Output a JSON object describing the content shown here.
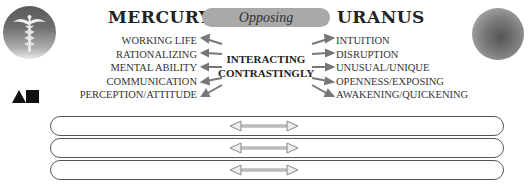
{
  "diagram": {
    "left_planet": {
      "name": "MERCURY",
      "icon": "caduceus-icon",
      "traits": [
        "WORKING LIFE",
        "RATIONALIZING",
        "MENTAL ABILITY",
        "COMMUNICATION",
        "PERCEPTION/ATTITUDE"
      ]
    },
    "right_planet": {
      "name": "URANUS",
      "icon": "shaded-sphere-icon",
      "traits": [
        "INTUITION",
        "DISRUPTION",
        "UNUSUAL/UNIQUE",
        "OPENNESS/EXPOSING",
        "AWAKENING/QUICKENING"
      ]
    },
    "aspect_label": "Opposing",
    "center_label": [
      "INTERACTING",
      "CONTRASTINGLY"
    ],
    "symbol": "triangle-square-icon",
    "bars": [
      {
        "arrow": "double-arrow-icon"
      },
      {
        "arrow": "double-arrow-icon"
      },
      {
        "arrow": "double-arrow-icon"
      }
    ],
    "colors": {
      "pill": "#a9a9a9",
      "arrow": "#888888",
      "text": "#2a2a2a",
      "bar_border": "#555555"
    }
  }
}
